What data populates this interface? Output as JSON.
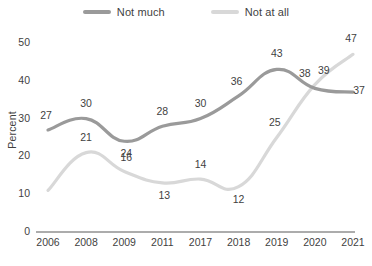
{
  "legend": {
    "items": [
      {
        "label": "Not much",
        "color": "#9a9a9a",
        "icon": "line-swatch-icon"
      },
      {
        "label": "Not at all",
        "color": "#d8d8d8",
        "icon": "line-swatch-icon"
      }
    ]
  },
  "axes": {
    "ylabel": "Percent",
    "yticks": [
      "0",
      "10",
      "20",
      "30",
      "40",
      "50"
    ],
    "xticks": [
      "2006",
      "2008",
      "2009",
      "2011",
      "2017",
      "2018",
      "2019",
      "2020",
      "2021"
    ]
  },
  "chart_data": {
    "type": "line",
    "title": "",
    "xlabel": "",
    "ylabel": "Percent",
    "categories": [
      "2006",
      "2008",
      "2009",
      "2011",
      "2017",
      "2018",
      "2019",
      "2020",
      "2021"
    ],
    "ylim": [
      0,
      50
    ],
    "yticks": [
      0,
      10,
      20,
      30,
      40,
      50
    ],
    "grid": false,
    "legend_position": "top-center",
    "series": [
      {
        "name": "Not much",
        "color": "#9a9a9a",
        "values": [
          27,
          30,
          24,
          28,
          30,
          36,
          43,
          38,
          37
        ],
        "labels": [
          "27",
          "30",
          "24",
          "28",
          "30",
          "36",
          "43",
          "38",
          "37"
        ]
      },
      {
        "name": "Not at all",
        "color": "#d8d8d8",
        "values": [
          11,
          21,
          16,
          13,
          14,
          12,
          25,
          39,
          47
        ],
        "labels": [
          "",
          "21",
          "16",
          "13",
          "14",
          "12",
          "25",
          "39",
          "47"
        ]
      }
    ]
  }
}
